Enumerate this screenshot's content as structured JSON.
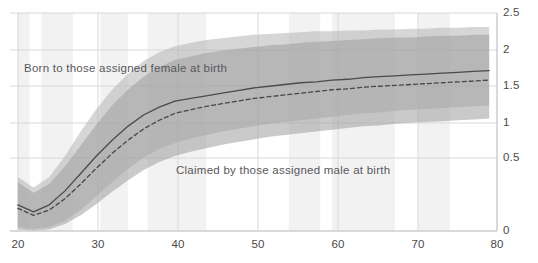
{
  "top_cut_text": "",
  "axes": {
    "y_ticks": [
      "2.5",
      "2",
      "1.5",
      "1",
      "0.5",
      "0"
    ],
    "x_ticks": [
      "20",
      "30",
      "40",
      "50",
      "60",
      "70",
      "80"
    ],
    "y_tick_y": [
      13,
      50,
      86,
      123,
      158,
      231
    ],
    "x_tick_x": [
      18,
      98,
      178,
      258,
      338,
      418,
      497
    ]
  },
  "annotations": {
    "female": "Born to those assigned female at birth",
    "male": "Claimed by those assigned male at birth"
  },
  "colors": {
    "band_female": "#b5b5b5",
    "band_male": "#9e9e9e",
    "line_female": "#4a4a50",
    "line_male": "#46464c",
    "gridline": "#d8d8dc",
    "stripe": "#f2f2f2",
    "background": "#ffffff",
    "tick_text": "#4a4a4a",
    "annotation_text": "#58585c"
  },
  "chart_data": {
    "type": "line",
    "title": "",
    "subtitle": "",
    "xlabel": "",
    "ylabel": "",
    "xlim": [
      19,
      81
    ],
    "ylim": [
      0,
      2.5
    ],
    "grid": true,
    "legend_position": "in-plot annotations",
    "y_axis_side": "right",
    "background_stripes": [
      {
        "x_start": 20,
        "x_end": 21.5
      },
      {
        "x_start": 23.0,
        "x_end": 27.0
      },
      {
        "x_start": 30.5,
        "x_end": 34.0
      },
      {
        "x_start": 36.5,
        "x_end": 44.0
      },
      {
        "x_start": 54.5,
        "x_end": 58.5
      },
      {
        "x_start": 60.0,
        "x_end": 68.0
      },
      {
        "x_start": 71.0,
        "x_end": 75.0
      }
    ],
    "x": [
      20,
      22,
      24,
      26,
      28,
      30,
      32,
      34,
      36,
      38,
      40,
      42,
      44,
      46,
      48,
      50,
      52,
      54,
      56,
      58,
      60,
      62,
      64,
      66,
      68,
      70,
      72,
      74,
      76,
      78,
      80
    ],
    "series": [
      {
        "name": "Born to those assigned female at birth",
        "style": "solid",
        "values": [
          0.3,
          0.22,
          0.3,
          0.46,
          0.66,
          0.86,
          1.04,
          1.2,
          1.33,
          1.42,
          1.49,
          1.52,
          1.55,
          1.58,
          1.61,
          1.64,
          1.66,
          1.68,
          1.7,
          1.71,
          1.73,
          1.74,
          1.76,
          1.77,
          1.78,
          1.79,
          1.8,
          1.81,
          1.82,
          1.83,
          1.84
        ],
        "band_lower": [
          0.05,
          0.02,
          0.05,
          0.12,
          0.24,
          0.4,
          0.56,
          0.71,
          0.84,
          0.94,
          1.01,
          1.06,
          1.1,
          1.14,
          1.17,
          1.2,
          1.23,
          1.25,
          1.27,
          1.29,
          1.31,
          1.33,
          1.35,
          1.36,
          1.38,
          1.39,
          1.4,
          1.41,
          1.42,
          1.43,
          1.44
        ],
        "band_upper": [
          0.62,
          0.5,
          0.62,
          0.86,
          1.14,
          1.4,
          1.62,
          1.8,
          1.95,
          2.05,
          2.12,
          2.16,
          2.19,
          2.21,
          2.23,
          2.25,
          2.26,
          2.27,
          2.28,
          2.29,
          2.29,
          2.3,
          2.3,
          2.31,
          2.31,
          2.32,
          2.32,
          2.33,
          2.33,
          2.34,
          2.34
        ]
      },
      {
        "name": "Claimed by those assigned male at birth",
        "style": "dashed",
        "values": [
          0.26,
          0.18,
          0.24,
          0.37,
          0.54,
          0.72,
          0.89,
          1.04,
          1.17,
          1.27,
          1.35,
          1.39,
          1.43,
          1.46,
          1.49,
          1.52,
          1.54,
          1.56,
          1.58,
          1.6,
          1.62,
          1.63,
          1.65,
          1.66,
          1.67,
          1.68,
          1.69,
          1.7,
          1.71,
          1.72,
          1.73
        ],
        "band_lower": [
          0.02,
          0.0,
          0.02,
          0.08,
          0.18,
          0.31,
          0.45,
          0.58,
          0.7,
          0.79,
          0.86,
          0.91,
          0.95,
          0.99,
          1.02,
          1.05,
          1.08,
          1.1,
          1.12,
          1.14,
          1.16,
          1.18,
          1.2,
          1.21,
          1.23,
          1.24,
          1.25,
          1.26,
          1.27,
          1.28,
          1.29
        ],
        "band_upper": [
          0.56,
          0.44,
          0.54,
          0.74,
          0.98,
          1.22,
          1.44,
          1.62,
          1.77,
          1.88,
          1.96,
          2.0,
          2.04,
          2.07,
          2.09,
          2.11,
          2.13,
          2.14,
          2.16,
          2.17,
          2.18,
          2.19,
          2.2,
          2.21,
          2.22,
          2.22,
          2.23,
          2.24,
          2.24,
          2.25,
          2.25
        ]
      }
    ]
  }
}
